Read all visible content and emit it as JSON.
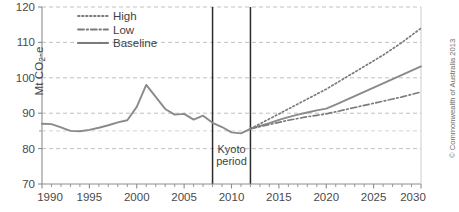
{
  "chart_data": {
    "type": "line",
    "title": "",
    "subtitle": "",
    "xlabel": "",
    "ylabel": "Mt CO2-e",
    "ylabel_parts": {
      "pre": "Mt CO",
      "sub": "2",
      "post": "-e"
    },
    "xlim": [
      1990,
      2030
    ],
    "ylim": [
      70,
      120
    ],
    "ytick_labels": [
      "70",
      "80",
      "90",
      "100",
      "110",
      "120"
    ],
    "ytick_values": [
      70,
      80,
      90,
      100,
      110,
      120
    ],
    "yminor_values": [
      85
    ],
    "xtick_labels": [
      "1990",
      "1995",
      "2000",
      "2005",
      "2010",
      "2015",
      "2020",
      "2025",
      "2030"
    ],
    "xtick_values": [
      1990,
      1995,
      2000,
      2005,
      2010,
      2015,
      2020,
      2025,
      2030
    ],
    "xminor_step": 1,
    "grid": "horizontal-dashed",
    "legend_position": "top-center",
    "legend": [
      {
        "label": "High",
        "style": "dotted",
        "color": "#7b7b7b"
      },
      {
        "label": "Low",
        "style": "dash-dot",
        "color": "#7b7b7b"
      },
      {
        "label": "Baseline",
        "style": "solid",
        "color": "#7b7b7b"
      }
    ],
    "annotations": [
      {
        "label": "Kyoto period",
        "line1": "Kyoto",
        "line2": "period",
        "x_start": 2008,
        "x_end": 2012,
        "type": "vertical-band-markers"
      }
    ],
    "series": [
      {
        "name": "Historical",
        "style": "solid",
        "color": "#8a8a8a",
        "x": [
          1990,
          1991,
          1992,
          1993,
          1994,
          1995,
          1996,
          1997,
          1998,
          1999,
          2000,
          2001,
          2002,
          2003,
          2004,
          2005,
          2006,
          2007,
          2008,
          2009,
          2010,
          2011,
          2012
        ],
        "values": [
          87.0,
          86.9,
          86.0,
          85.0,
          84.9,
          85.3,
          85.9,
          86.6,
          87.4,
          88.0,
          91.8,
          98.0,
          94.6,
          91.2,
          89.6,
          89.8,
          88.2,
          89.3,
          87.3,
          86.1,
          84.6,
          84.3,
          85.6
        ]
      },
      {
        "name": "Baseline",
        "style": "solid",
        "color": "#8a8a8a",
        "x": [
          2012,
          2013,
          2014,
          2015,
          2016,
          2017,
          2018,
          2019,
          2020,
          2021,
          2022,
          2023,
          2024,
          2025,
          2026,
          2027,
          2028,
          2029,
          2030
        ],
        "values": [
          85.6,
          86.4,
          87.2,
          88.1,
          88.9,
          89.6,
          90.2,
          90.8,
          91.3,
          92.4,
          93.6,
          94.8,
          96.0,
          97.2,
          98.4,
          99.6,
          100.8,
          102.0,
          103.2
        ]
      },
      {
        "name": "High",
        "style": "dotted",
        "color": "#7b7b7b",
        "x": [
          2012,
          2013,
          2014,
          2015,
          2016,
          2017,
          2018,
          2019,
          2020,
          2021,
          2022,
          2023,
          2024,
          2025,
          2026,
          2027,
          2028,
          2029,
          2030
        ],
        "values": [
          85.6,
          87.0,
          88.4,
          89.8,
          91.2,
          92.6,
          94.0,
          95.4,
          96.8,
          98.4,
          100.0,
          101.6,
          103.2,
          104.8,
          106.4,
          108.2,
          110.0,
          112.0,
          114.0
        ]
      },
      {
        "name": "Low",
        "style": "dash-dot",
        "color": "#7b7b7b",
        "x": [
          2012,
          2013,
          2014,
          2015,
          2016,
          2017,
          2018,
          2019,
          2020,
          2021,
          2022,
          2023,
          2024,
          2025,
          2026,
          2027,
          2028,
          2029,
          2030
        ],
        "values": [
          85.6,
          86.2,
          86.8,
          87.4,
          88.0,
          88.5,
          89.0,
          89.4,
          89.8,
          90.4,
          91.0,
          91.6,
          92.2,
          92.8,
          93.4,
          94.0,
          94.6,
          95.3,
          96.0
        ]
      }
    ]
  },
  "credit": {
    "text": "© Commonwealth of Australia 2013"
  }
}
